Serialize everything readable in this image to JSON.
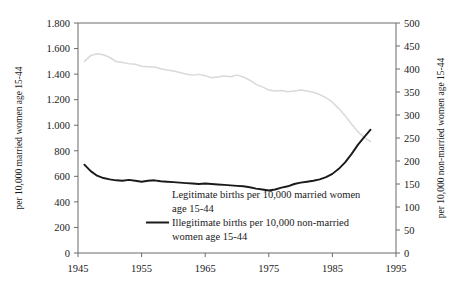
{
  "chart_data": {
    "type": "line",
    "title": "",
    "subtitle": "",
    "xlabel": "",
    "ylabel": "per 10,000 married women age 15-44",
    "ylabel_right": "per 10,000 non-married women age 15-44",
    "xlim": [
      1945,
      1995
    ],
    "ylim": [
      0,
      1800
    ],
    "ylim_right": [
      0,
      500
    ],
    "grid": false,
    "legend_position": "inside-bottom-left",
    "x_ticks": [
      "1945",
      "1955",
      "1965",
      "1975",
      "1985",
      "1995"
    ],
    "x_tick_values": [
      1945,
      1955,
      1965,
      1975,
      1985,
      1995
    ],
    "y_ticks_left": [
      "0",
      "200",
      "400",
      "600",
      "800",
      "1.000",
      "1.200",
      "1.400",
      "1.600",
      "1.800"
    ],
    "y_tick_values_left": [
      0,
      200,
      400,
      600,
      800,
      1000,
      1200,
      1400,
      1600,
      1800
    ],
    "y_ticks_right": [
      "0",
      "50",
      "100",
      "150",
      "200",
      "250",
      "300",
      "350",
      "400",
      "450",
      "500"
    ],
    "y_tick_values_right": [
      0,
      50,
      100,
      150,
      200,
      250,
      300,
      350,
      400,
      450,
      500
    ],
    "series": [
      {
        "name": "Legitimate births per 10,000 married women age 15-44",
        "axis": "left",
        "color": "#d9d9d9",
        "x": [
          1946,
          1947,
          1948,
          1949,
          1950,
          1951,
          1952,
          1953,
          1954,
          1955,
          1956,
          1957,
          1958,
          1959,
          1960,
          1961,
          1962,
          1963,
          1964,
          1965,
          1966,
          1967,
          1968,
          1969,
          1970,
          1971,
          1972,
          1973,
          1974,
          1975,
          1976,
          1977,
          1978,
          1979,
          1980,
          1981,
          1982,
          1983,
          1984,
          1985,
          1986,
          1987,
          1988,
          1989,
          1990,
          1991
        ],
        "values": [
          1500,
          1545,
          1560,
          1552,
          1530,
          1498,
          1490,
          1482,
          1478,
          1462,
          1458,
          1455,
          1442,
          1432,
          1425,
          1412,
          1400,
          1392,
          1398,
          1388,
          1372,
          1378,
          1385,
          1380,
          1392,
          1378,
          1352,
          1320,
          1300,
          1275,
          1268,
          1272,
          1262,
          1268,
          1275,
          1268,
          1258,
          1240,
          1215,
          1180,
          1130,
          1075,
          1010,
          950,
          905,
          872
        ]
      },
      {
        "name": "Illegitimate births per 10,000 non-married women age 15-44",
        "axis": "right",
        "color": "#1a1a1a",
        "x": [
          1946,
          1947,
          1948,
          1949,
          1950,
          1951,
          1952,
          1953,
          1954,
          1955,
          1956,
          1957,
          1958,
          1959,
          1960,
          1961,
          1962,
          1963,
          1964,
          1965,
          1966,
          1967,
          1968,
          1969,
          1970,
          1971,
          1972,
          1973,
          1974,
          1975,
          1976,
          1977,
          1978,
          1979,
          1980,
          1981,
          1982,
          1983,
          1984,
          1985,
          1986,
          1987,
          1988,
          1989,
          1990,
          1991
        ],
        "values": [
          192,
          178,
          168,
          163,
          160,
          158,
          157,
          159,
          157,
          155,
          157,
          158,
          156,
          155,
          154,
          153,
          152,
          151,
          150,
          151,
          150,
          149,
          148,
          147,
          146,
          145,
          143,
          140,
          138,
          136,
          138,
          142,
          145,
          150,
          153,
          155,
          157,
          160,
          165,
          172,
          183,
          197,
          215,
          235,
          252,
          268
        ]
      }
    ],
    "legend": [
      {
        "label_line1": "Legitimate births per 10,000 married women",
        "label_line2": "age 15-44",
        "swatch": "none",
        "color": "#d9d9d9"
      },
      {
        "label_line1": "Illegitimate births per 10,000 non-married",
        "label_line2": "women age 15-44",
        "swatch": "line",
        "color": "#1a1a1a"
      }
    ]
  },
  "axes": {
    "left_title": "per 10,000 married women age 15-44",
    "right_title": "per 10,000 non-married women age 15-44"
  }
}
